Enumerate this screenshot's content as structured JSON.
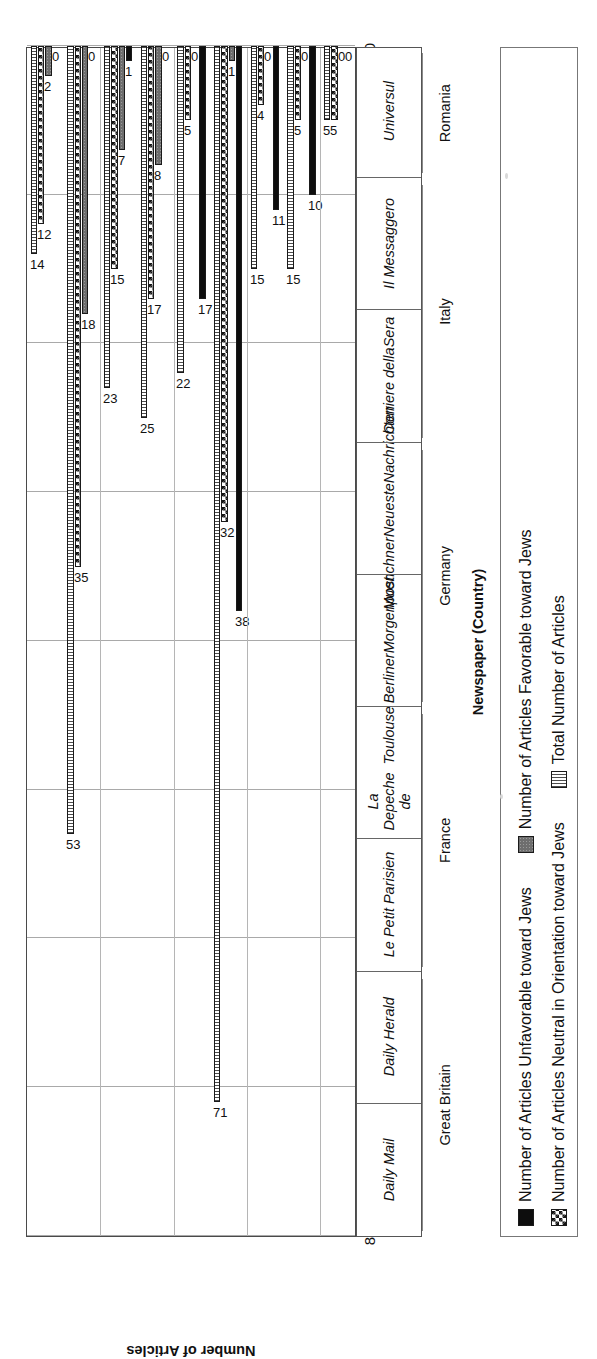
{
  "chart_data": {
    "type": "bar",
    "orientation": "horizontal",
    "title": "",
    "xlabel": "Newspaper (Country)",
    "ylabel": "Number of Articles",
    "value_axis_ticks": [
      0,
      10,
      20,
      30,
      40,
      50,
      60,
      70,
      80
    ],
    "value_axis_ticks_display": [
      "80",
      "70",
      "60",
      "50",
      "40",
      "30",
      "20",
      "10",
      "0"
    ],
    "ylim": [
      0,
      80
    ],
    "grid": true,
    "legend_position": "below-axis",
    "categories": [
      "Daily Mail",
      "Daily Herald",
      "Le Petit Parisien",
      "La Depeche de Toulouse",
      "Berliner Morgenpost",
      "Muenchner Neueste Nachrichten",
      "Corriere della Sera",
      "Il Messaggero",
      "Universul"
    ],
    "category_lines": [
      [
        "Daily Mail"
      ],
      [
        "Daily Herald"
      ],
      [
        "Le Petit Parisien"
      ],
      [
        "La Depeche de",
        "Toulouse"
      ],
      [
        "Berliner",
        "Morgenpost"
      ],
      [
        "Muenchner",
        "Neueste",
        "Nachrichten"
      ],
      [
        "Corriere della",
        "Sera"
      ],
      [
        "Il Messaggero"
      ],
      [
        "Universul"
      ]
    ],
    "groups": [
      {
        "label": "Great Britain",
        "start": 0,
        "count": 2
      },
      {
        "label": "France",
        "start": 2,
        "count": 2
      },
      {
        "label": "Germany",
        "start": 4,
        "count": 2
      },
      {
        "label": "Italy",
        "start": 6,
        "count": 2
      },
      {
        "label": "Romania",
        "start": 8,
        "count": 1
      }
    ],
    "series": [
      {
        "name": "Number of Articles Unfavorable toward Jews",
        "pattern": "solid-black",
        "color": "#0d0d0d",
        "values": [
          0,
          0,
          1,
          0,
          17,
          38,
          11,
          10,
          0
        ]
      },
      {
        "name": "Number of Articles Neutral in Orientation toward Jews",
        "pattern": "checkerboard",
        "color": "#141414",
        "values": [
          12,
          35,
          15,
          17,
          5,
          32,
          4,
          5,
          5
        ]
      },
      {
        "name": "Number of Articles Favorable toward Jews",
        "pattern": "gray-dotted",
        "color": "#6e6e6e",
        "values": [
          2,
          18,
          7,
          8,
          0,
          1,
          0,
          0,
          0
        ]
      },
      {
        "name": "Total Number of Articles",
        "pattern": "vertical-stripe",
        "color": "#4d4d4d",
        "values": [
          14,
          53,
          23,
          25,
          22,
          71,
          15,
          15,
          5
        ]
      }
    ],
    "bar_draw_order": [
      {
        "series": 3,
        "pattern": "stripe"
      },
      {
        "series": 1,
        "pattern": "check"
      },
      {
        "series": 2,
        "pattern": "gray"
      },
      {
        "series": 0,
        "pattern": "black"
      }
    ]
  },
  "legend": {
    "items": [
      {
        "label": "Number of Articles Unfavorable toward Jews",
        "pattern": "black"
      },
      {
        "label": "Number of Articles Favorable toward Jews",
        "pattern": "gray"
      },
      {
        "label": "Number of Articles Neutral in Orientation toward Jews",
        "pattern": "check"
      },
      {
        "label": "Total Number of Articles",
        "pattern": "stripe"
      }
    ]
  },
  "axes": {
    "value_title": "Number of Articles",
    "category_title": "Newspaper (Country)"
  }
}
